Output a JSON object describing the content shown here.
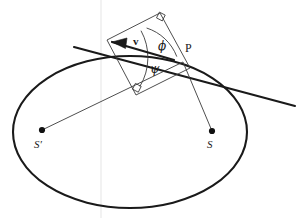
{
  "figure": {
    "background_color": "#ffffff",
    "stroke_color": "#1a1a1a",
    "labels": {
      "point_p": "P",
      "focus_s": "S",
      "focus_s_prime": "S′",
      "velocity_vector": "v",
      "angle_phi": "ϕ",
      "angle_psi": "ψ"
    },
    "elements": {
      "ellipse_name": "orbit-ellipse",
      "tangent_name": "tangent-line",
      "radius_s_name": "radius-vector-to-S",
      "radius_s_prime_name": "radius-vector-to-S-prime",
      "rectangle_name": "velocity-decomposition-rectangle",
      "arrow_name": "velocity-arrow",
      "right_angle_top_name": "right-angle-marker-top",
      "right_angle_bottom_name": "right-angle-marker-bottom",
      "arc_phi_name": "angle-arc-phi",
      "arc_psi_name": "angle-arc-psi"
    }
  },
  "geometry": {
    "ellipse": {
      "cx": 130,
      "cy": 132,
      "rx": 117,
      "ry": 76
    },
    "point_p": {
      "x": 183,
      "y": 62
    },
    "focus_s": {
      "x": 212,
      "y": 131
    },
    "focus_s_prime": {
      "x": 42,
      "y": 130
    },
    "tangent": {
      "x1": 74,
      "y1": 47,
      "x2": 295,
      "y2": 106
    },
    "rect": {
      "a": {
        "x": 107,
        "y": 40
      },
      "b": {
        "x": 160,
        "y": 13
      },
      "c": {
        "x": 190,
        "y": 68
      },
      "d": {
        "x": 136,
        "y": 95
      }
    },
    "arrow": {
      "x1": 174,
      "y1": 60,
      "x2": 107,
      "y2": 40
    }
  },
  "label_positions": {
    "point_p": {
      "left": 185,
      "top": 42
    },
    "focus_s": {
      "left": 207,
      "top": 139
    },
    "focus_s_prime": {
      "left": 34,
      "top": 139
    },
    "velocity_vector": {
      "left": 133,
      "top": 36
    },
    "angle_phi": {
      "left": 158,
      "top": 40
    },
    "angle_psi": {
      "left": 150,
      "top": 63
    }
  }
}
